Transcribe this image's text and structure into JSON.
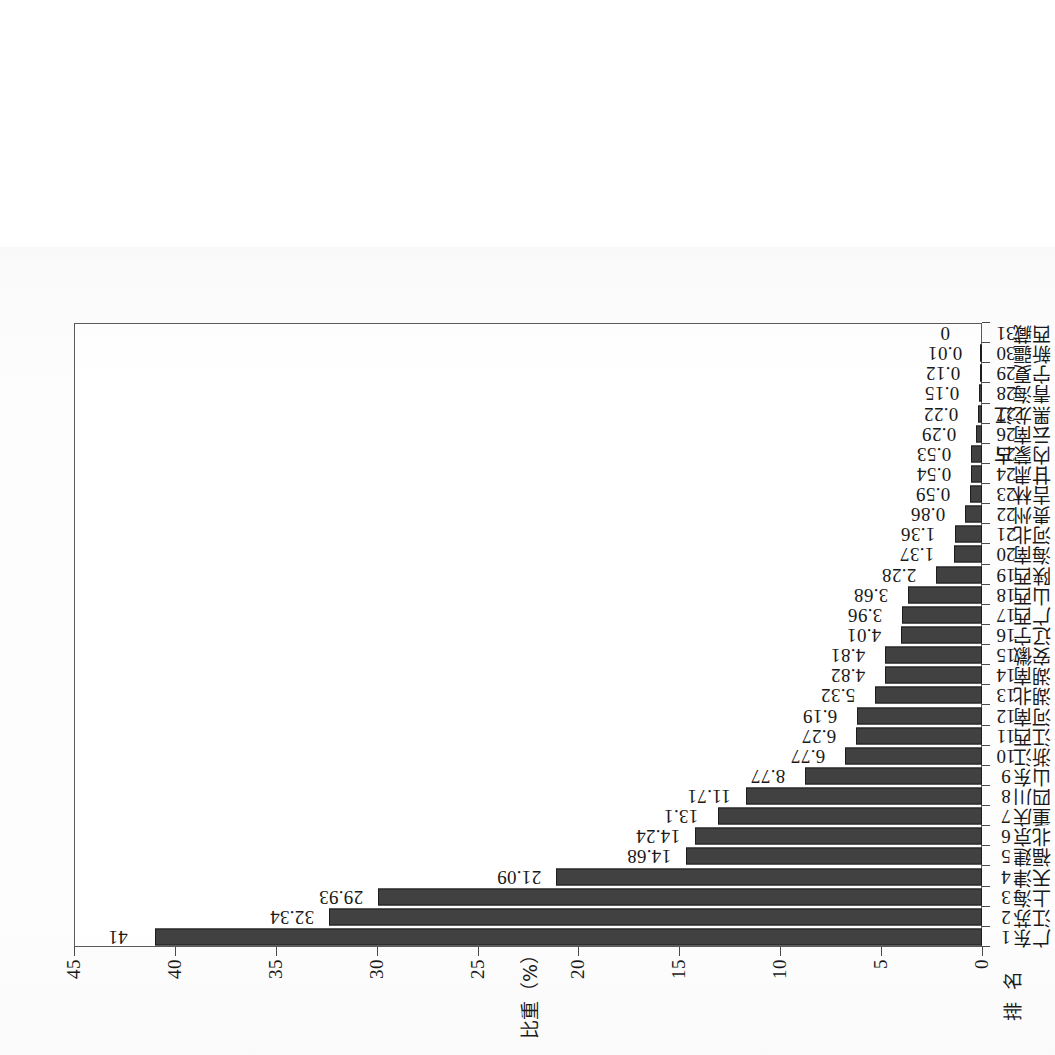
{
  "chart_data": {
    "type": "bar",
    "title": "",
    "xlabel": "排 名",
    "ylabel": "比重（%）",
    "ylim": [
      0,
      45
    ],
    "yticks": [
      "0",
      "5",
      "10",
      "15",
      "20",
      "25",
      "30",
      "35",
      "40",
      "45"
    ],
    "grid": false,
    "legend": "none",
    "orientation": "vertical-bars-on-rotated-page",
    "categories": [
      "广东",
      "江苏",
      "上海",
      "天津",
      "福建",
      "北京",
      "重庆",
      "四川",
      "山东",
      "浙江",
      "江西",
      "河南",
      "湖北",
      "湖南",
      "安徽",
      "辽宁",
      "广西",
      "山西",
      "陕西",
      "海南",
      "河北",
      "贵州",
      "吉林",
      "甘肃",
      "内蒙古",
      "云南",
      "黑龙江",
      "青海",
      "宁夏",
      "新疆",
      "西藏"
    ],
    "ranks": [
      "1",
      "2",
      "3",
      "4",
      "5",
      "6",
      "7",
      "8",
      "9",
      "10",
      "11",
      "12",
      "13",
      "14",
      "15",
      "16",
      "17",
      "18",
      "19",
      "20",
      "21",
      "22",
      "23",
      "24",
      "25",
      "26",
      "27",
      "28",
      "29",
      "30",
      "31"
    ],
    "values": [
      41,
      32.34,
      29.93,
      21.09,
      14.68,
      14.24,
      13.1,
      11.71,
      8.77,
      6.77,
      6.27,
      6.19,
      5.32,
      4.82,
      4.81,
      4.01,
      3.96,
      3.68,
      2.28,
      1.37,
      1.36,
      0.86,
      0.59,
      0.54,
      0.53,
      0.29,
      0.22,
      0.15,
      0.12,
      0.01,
      0
    ],
    "value_labels": [
      "41",
      "32.34",
      "29.93",
      "21.09",
      "14.68",
      "14.24",
      "13.1",
      "11.71",
      "8.77",
      "6.77",
      "6.27",
      "6.19",
      "5.32",
      "4.82",
      "4.81",
      "4.01",
      "3.96",
      "3.68",
      "2.28",
      "1.37",
      "1.36",
      "0.86",
      "0.59",
      "0.54",
      "0.53",
      "0.29",
      "0.22",
      "0.15",
      "0.12",
      "0.01",
      "0"
    ],
    "colors": {
      "bar_fill": "#414141",
      "bar_outline": "#1c1c1c",
      "axis": "#5a5a5a",
      "text": "#1a1a1a",
      "background": "#ffffff"
    }
  }
}
